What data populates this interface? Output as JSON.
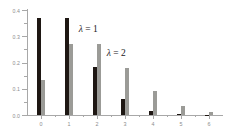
{
  "chart_data": {
    "type": "bar",
    "title": "",
    "subtitle": "",
    "xlabel": "",
    "ylabel": "",
    "categories": [
      "0",
      "1",
      "2",
      "3",
      "4",
      "5",
      "6"
    ],
    "x": [
      0,
      1,
      2,
      3,
      4,
      5,
      6
    ],
    "series": [
      {
        "name": "λ = 1",
        "color": "#1e1713",
        "values": [
          0.368,
          0.368,
          0.184,
          0.061,
          0.015,
          0.003,
          0.001
        ]
      },
      {
        "name": "λ = 2",
        "color": "#9b9b97",
        "values": [
          0.135,
          0.271,
          0.271,
          0.18,
          0.09,
          0.036,
          0.012
        ]
      }
    ],
    "ylim": [
      0.0,
      0.4
    ],
    "xlim": [
      -0.5,
      6.5
    ],
    "ytick_labels": [
      "0.0",
      "0.1",
      "0.2",
      "0.3",
      "0.4"
    ],
    "ytick_values": [
      0.0,
      0.1,
      0.2,
      0.3,
      0.4
    ],
    "yminor_tick_values": [
      0.05,
      0.15,
      0.25,
      0.35
    ],
    "xtick_labels": [
      "0",
      "1",
      "2",
      "3",
      "4",
      "5",
      "6"
    ],
    "grid": false,
    "legend": "none",
    "annotations": [
      {
        "symbol": "λ",
        "eq": "=",
        "value": "1",
        "x": 1.35,
        "y": 0.345
      },
      {
        "symbol": "λ",
        "eq": "=",
        "value": "2",
        "x": 2.35,
        "y": 0.255
      }
    ]
  },
  "axis": {
    "line_color": "#a8a8a8",
    "tick_label_color": "#8d8d8d"
  },
  "background": "#ffffff"
}
